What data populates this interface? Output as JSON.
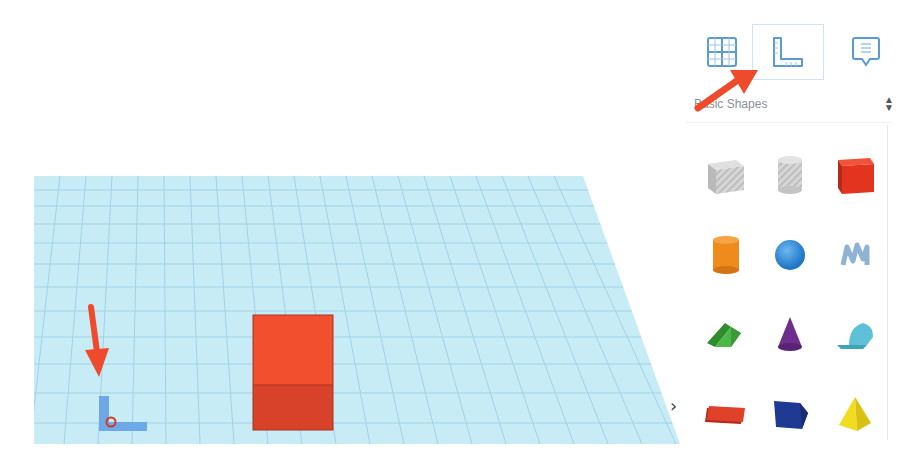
{
  "workplane": {
    "color": "#c8ecf6",
    "grid_color": "#8fc9e2",
    "cube_color_top": "#f2502f",
    "cube_color_front": "#d9432a"
  },
  "panel": {
    "tabs": [
      {
        "id": "workplane",
        "icon": "grid-icon",
        "selected": false
      },
      {
        "id": "ruler",
        "icon": "ruler-icon",
        "selected": true
      },
      {
        "id": "notes",
        "icon": "note-icon",
        "selected": false
      }
    ],
    "category": {
      "label": "Basic Shapes",
      "icon": "updown-icon"
    },
    "shapes": [
      {
        "name": "box-hole",
        "color": "#c9c9c9"
      },
      {
        "name": "cylinder-hole",
        "color": "#c9c9c9"
      },
      {
        "name": "box",
        "color": "#e8341f"
      },
      {
        "name": "cylinder",
        "color": "#f08a1c"
      },
      {
        "name": "sphere",
        "color": "#2e8fe0"
      },
      {
        "name": "scribble",
        "color": "#8fb3d4"
      },
      {
        "name": "roof",
        "color": "#3fae3b"
      },
      {
        "name": "cone",
        "color": "#6d2f8e"
      },
      {
        "name": "round-roof",
        "color": "#5fc1d8"
      },
      {
        "name": "text",
        "color": "#d9361f"
      },
      {
        "name": "polygon",
        "color": "#1f3a93"
      },
      {
        "name": "pyramid",
        "color": "#f2dc22"
      }
    ]
  },
  "annotations": {
    "arrow_color": "#ef4a2c"
  },
  "chevron": {
    "label": "›"
  }
}
